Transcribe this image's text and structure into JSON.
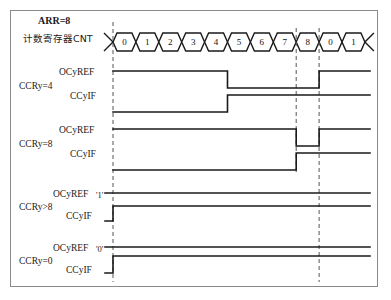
{
  "diagram": {
    "title_note": "ARR=8",
    "counter_row_label": "计数寄存器CNT",
    "counter_values": [
      "0",
      "1",
      "2",
      "3",
      "4",
      "5",
      "6",
      "7",
      "8",
      "0",
      "1"
    ],
    "arr": 8,
    "groups": [
      {
        "id": "ccry4",
        "label": "CCRy=4",
        "signals": [
          {
            "id": "ocyref",
            "name": "OCyREF",
            "level_tag": "",
            "transitions": "high until CNT=4 end, low, high again at CNT=0 restart"
          },
          {
            "id": "ccyif",
            "name": "CCyIF",
            "level_tag": "",
            "transitions": "low until CNT=4 end, then high"
          }
        ]
      },
      {
        "id": "ccry8",
        "label": "CCRy=8",
        "signals": [
          {
            "id": "ocyref",
            "name": "OCyREF",
            "level_tag": "",
            "transitions": "high until CNT=8 start, low during CNT=8, high at CNT=0 restart"
          },
          {
            "id": "ccyif",
            "name": "CCyIF",
            "level_tag": "",
            "transitions": "low until CNT=8 start, then high"
          }
        ]
      },
      {
        "id": "ccry_gt8",
        "label": "CCRy>8",
        "signals": [
          {
            "id": "ocyref",
            "name": "OCyREF",
            "level_tag": "'1'",
            "transitions": "constant high"
          },
          {
            "id": "ccyif",
            "name": "CCyIF",
            "level_tag": "",
            "transitions": "rises at CNT=0 and stays high"
          }
        ]
      },
      {
        "id": "ccry0",
        "label": "CCRy=0",
        "signals": [
          {
            "id": "ocyref",
            "name": "OCyREF",
            "level_tag": "'0'",
            "transitions": "constant low"
          },
          {
            "id": "ccyif",
            "name": "CCyIF",
            "level_tag": "",
            "transitions": "rises at CNT=0 and stays high"
          }
        ]
      }
    ],
    "marker_lines": [
      {
        "id": "start-of-period",
        "at_counter": "0"
      },
      {
        "id": "counter-equals-arr",
        "at_counter": "8"
      },
      {
        "id": "counter-rollover",
        "at_counter": "0"
      }
    ],
    "colors": {
      "frame": "#8a8a8a",
      "waveform": "#1a1a1a",
      "marker": "#555555",
      "text": "#111111"
    }
  }
}
